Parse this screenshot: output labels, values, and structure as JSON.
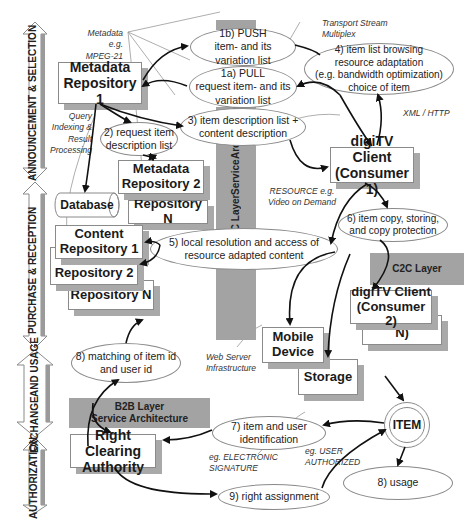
{
  "phases": [
    {
      "label": "ANNOUNCEMENT & SELECTION"
    },
    {
      "label": "PURCHASE & RECEPTION"
    },
    {
      "label": "EXCHANGE AND USAGE",
      "line1": "EXCHANGE",
      "line2": "AND USAGE"
    },
    {
      "label": "AUTHORIZATION"
    }
  ],
  "layers": {
    "b2c": {
      "line1": "B2C Layer",
      "line2": "Service",
      "line3": "Architecture"
    },
    "c2c": {
      "label": "C2C Layer"
    },
    "b2b": {
      "line1": "B2B Layer",
      "line2": "Service Architecture"
    }
  },
  "boxes": {
    "metadata_repo_1": {
      "line1": "Metadata",
      "line2": "Repository 1"
    },
    "metadata_repo_2": {
      "line1": "Metadata",
      "line2": "Repository 2"
    },
    "metadata_repo_n": {
      "label": "Repository N"
    },
    "database": {
      "label": "Database"
    },
    "content_repo_1": {
      "line1": "Content",
      "line2": "Repository 1"
    },
    "content_repo_2": {
      "line1": "Content",
      "line2": "Repository 2"
    },
    "content_repo_n": {
      "label": "Repository N"
    },
    "digitv_client_1": {
      "line1": "digiTV Client",
      "line2": "(Consumer 1)"
    },
    "digitv_client_2": {
      "line1": "digiTV Client",
      "line2": "(Consumer 2)"
    },
    "digitv_client_n": {
      "label": "(Consumer N)"
    },
    "mobile_device": {
      "line1": "Mobile",
      "line2": "Device"
    },
    "storage": {
      "label": "Storage"
    },
    "right_clearing": {
      "line1": "Right Clearing",
      "line2": "Authority"
    },
    "item": {
      "label": "ITEM"
    }
  },
  "steps": {
    "push": {
      "line1": "1b) PUSH",
      "line2": "item- and its",
      "line3": "variation list"
    },
    "pull": {
      "line1": "1a) PULL",
      "line2": "request item- and its",
      "line3": "variation list"
    },
    "request_desc": {
      "line1": "2) request item",
      "line2": "description list"
    },
    "item_desc": {
      "line1": "3) item description list +",
      "line2": "content description"
    },
    "browsing": {
      "line1": "4) item list browsing",
      "line2": "resource adaptation",
      "line3": "(e.g. bandwidth optimization)",
      "line4": "choice of item"
    },
    "local_resolution": {
      "line1": "5) local resolution and access of",
      "line2": "resource adapted content"
    },
    "copy": {
      "line1": "6) item copy, storing,",
      "line2": "and copy protection"
    },
    "identification": {
      "line1": "7) item and user",
      "line2": "identification"
    },
    "matching": {
      "line1": "8) matching of item id",
      "line2": "and user id"
    },
    "usage": {
      "label": "8) usage"
    },
    "right_assignment": {
      "label": "9) right assignment"
    }
  },
  "notes": {
    "metadata": {
      "line1": "Metadata e.g.",
      "line2": "MPEG-21"
    },
    "query": {
      "line1": "Query",
      "line2": "Indexing &",
      "line3": "Result",
      "line4": "Processing"
    },
    "transport": {
      "line1": "Transport Stream",
      "line2": "Multiplex"
    },
    "xml": {
      "label": "XML / HTTP"
    },
    "resource": {
      "line1": "RESOURCE e.g.",
      "line2": "Video on Demand"
    },
    "webserver": {
      "line1": "Web Server",
      "line2": "Infrastructure"
    },
    "signature": {
      "line1": "eg. ELECTRONIC",
      "line2": "SIGNATURE"
    },
    "authorized": {
      "line1": "eg. USER",
      "line2": "AUTHORIZED"
    }
  },
  "colors": {
    "layer_gray": "#a3a3a3",
    "shadow_gray": "#a9a9a9",
    "arrow": "#111111"
  }
}
